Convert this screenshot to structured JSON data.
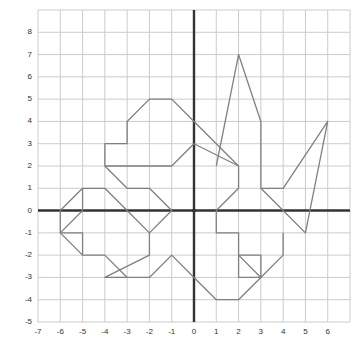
{
  "chart_data": {
    "type": "line",
    "title": "",
    "xlabel": "",
    "ylabel": "",
    "xlim": [
      -7,
      7
    ],
    "ylim": [
      -5,
      9
    ],
    "xticks": [
      -7,
      -6,
      -5,
      -4,
      -3,
      -2,
      -1,
      0,
      1,
      2,
      3,
      4,
      5,
      6
    ],
    "yticks": [
      -5,
      -4,
      -3,
      -2,
      -1,
      0,
      1,
      2,
      3,
      4,
      5,
      6,
      7,
      8
    ],
    "xtick_labels": [
      "-7",
      "-6",
      "-5",
      "-4",
      "-3",
      "-2",
      "-1",
      "0",
      "1",
      "2",
      "3",
      "4",
      "5",
      "6"
    ],
    "ytick_labels": [
      "-5",
      "-4",
      "-3",
      "-2",
      "-1",
      "0",
      "1",
      "2",
      "3",
      "4",
      "5",
      "6",
      "7",
      "8"
    ],
    "grid": true,
    "grid_color": "#cccccc",
    "axis_color": "#333333",
    "background": "#ffffff",
    "series": [
      {
        "name": "figure-outline",
        "color": "#808080",
        "closed": true,
        "points": [
          [
            -1.0,
            0.0
          ],
          [
            -2.0,
            1.0
          ],
          [
            -3.0,
            1.0
          ],
          [
            -4.0,
            2.0
          ],
          [
            -4.0,
            3.0
          ],
          [
            -3.0,
            3.0
          ],
          [
            -3.0,
            4.0
          ],
          [
            -2.0,
            5.0
          ],
          [
            -1.0,
            5.0
          ],
          [
            0.0,
            4.0
          ],
          [
            1.0,
            3.0
          ],
          [
            2.0,
            2.0
          ],
          [
            2.0,
            1.0
          ],
          [
            1.0,
            0.0
          ],
          [
            1.0,
            -1.0
          ],
          [
            2.0,
            -1.0
          ],
          [
            2.0,
            -2.0
          ],
          [
            3.0,
            -2.0
          ],
          [
            3.0,
            -3.0
          ],
          [
            2.0,
            -4.0
          ],
          [
            1.0,
            -4.0
          ],
          [
            0.0,
            -3.0
          ],
          [
            -1.0,
            -2.0
          ],
          [
            -2.0,
            -3.0
          ],
          [
            -3.0,
            -3.0
          ],
          [
            -4.0,
            -2.0
          ],
          [
            -5.0,
            -2.0
          ],
          [
            -5.0,
            -1.0
          ],
          [
            -6.0,
            -1.0
          ],
          [
            -6.0,
            0.0
          ],
          [
            -5.0,
            1.0
          ],
          [
            -4.0,
            1.0
          ],
          [
            -3.0,
            0.0
          ],
          [
            -2.0,
            -1.0
          ],
          [
            -1.0,
            0.0
          ]
        ]
      },
      {
        "name": "figure-detail-upper-right",
        "color": "#808080",
        "closed": false,
        "points": [
          [
            1.0,
            2.0
          ],
          [
            2.0,
            7.0
          ],
          [
            3.0,
            4.0
          ],
          [
            3.0,
            1.0
          ],
          [
            4.0,
            0.0
          ],
          [
            5.0,
            -1.0
          ],
          [
            6.0,
            4.0
          ],
          [
            4.0,
            1.0
          ],
          [
            3.0,
            1.0
          ]
        ]
      },
      {
        "name": "figure-detail-lower-right",
        "color": "#808080",
        "closed": false,
        "points": [
          [
            4.0,
            -1.0
          ],
          [
            4.0,
            -2.0
          ],
          [
            3.0,
            -3.0
          ],
          [
            2.0,
            -2.0
          ],
          [
            2.0,
            -3.0
          ],
          [
            3.0,
            -3.0
          ]
        ]
      },
      {
        "name": "figure-detail-left",
        "color": "#808080",
        "closed": false,
        "points": [
          [
            -4.0,
            2.0
          ],
          [
            -1.0,
            2.0
          ],
          [
            0.0,
            3.0
          ],
          [
            2.0,
            2.0
          ]
        ]
      },
      {
        "name": "figure-detail-left-lower",
        "color": "#808080",
        "closed": false,
        "points": [
          [
            -5.0,
            1.0
          ],
          [
            -5.0,
            0.0
          ],
          [
            -6.0,
            -1.0
          ],
          [
            -5.0,
            -2.0
          ]
        ]
      },
      {
        "name": "figure-detail-foot",
        "color": "#808080",
        "closed": false,
        "points": [
          [
            -2.0,
            -1.0
          ],
          [
            -2.0,
            -2.0
          ],
          [
            -4.0,
            -3.0
          ],
          [
            -3.0,
            -3.0
          ]
        ]
      }
    ]
  }
}
